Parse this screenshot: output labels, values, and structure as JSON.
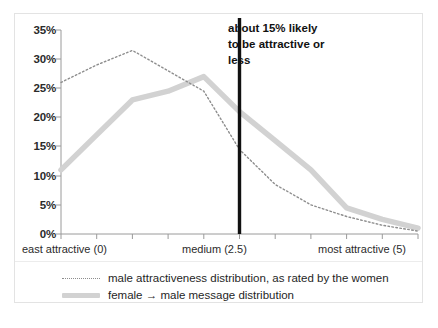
{
  "chart_data": {
    "type": "line",
    "title": "",
    "subtitle": "",
    "xlabel": "",
    "ylabel": "",
    "xlim": [
      0,
      5
    ],
    "ylim": [
      0,
      35
    ],
    "grid": false,
    "legend_position": "bottom",
    "y_ticks": [
      "35%",
      "30%",
      "25%",
      "20%",
      "15%",
      "10%",
      "5%",
      "0%"
    ],
    "y_tick_values": [
      35,
      30,
      25,
      20,
      15,
      10,
      5,
      0
    ],
    "x_category_labels": [
      "east attractive (0)",
      "medium (2.5)",
      "most attractive (5)"
    ],
    "x_category_values": [
      0,
      2.5,
      5
    ],
    "x_tick_values": [
      0,
      0.5,
      1,
      1.5,
      2,
      2.5,
      3,
      3.5,
      4,
      4.5,
      5
    ],
    "x": [
      0,
      0.5,
      1,
      1.5,
      2,
      2.5,
      3,
      3.5,
      4,
      4.5,
      5
    ],
    "series": [
      {
        "name": "male attractiveness distribution, as rated by the women",
        "style": "dotted",
        "color": "#8d8d8d",
        "values": [
          26,
          29,
          31.5,
          28,
          24.5,
          14.5,
          8.5,
          5,
          3,
          1.5,
          0.5
        ]
      },
      {
        "name": "female → male message distribution",
        "style": "solid-thick",
        "color": "#d2d2d2",
        "values": [
          11,
          17,
          23,
          24.5,
          27,
          21,
          16,
          11,
          4.5,
          2.5,
          1
        ]
      }
    ],
    "annotations": [
      {
        "name": "medium-marker",
        "type": "vline",
        "x": 2.5,
        "color": "#111111"
      },
      {
        "name": "likelihood-note",
        "type": "text",
        "lines": [
          "about 15% likely",
          "to be attractive or",
          "less"
        ]
      }
    ]
  },
  "legend": {
    "items": [
      {
        "swatch": "dotted-line-swatch",
        "label": "male attractiveness distribution, as rated by the women"
      },
      {
        "swatch": "thick-gray-line-swatch",
        "label": "female → male message distribution"
      }
    ]
  },
  "axes": {
    "y_labels": [
      "35%",
      "30%",
      "25%",
      "20%",
      "15%",
      "10%",
      "5%",
      "0%"
    ],
    "x_labels": {
      "left": "east attractive (0)",
      "middle": "medium (2.5)",
      "right": "most attractive (5)"
    }
  },
  "annotation": {
    "line1": "about 15% likely",
    "line2": "to be attractive or",
    "line3": "less"
  },
  "colors": {
    "dotted_series": "#8d8d8d",
    "solid_series": "#d2d2d2",
    "marker_line": "#111111",
    "axis": "#9a9a9a",
    "frame": "#e3e3e3"
  }
}
